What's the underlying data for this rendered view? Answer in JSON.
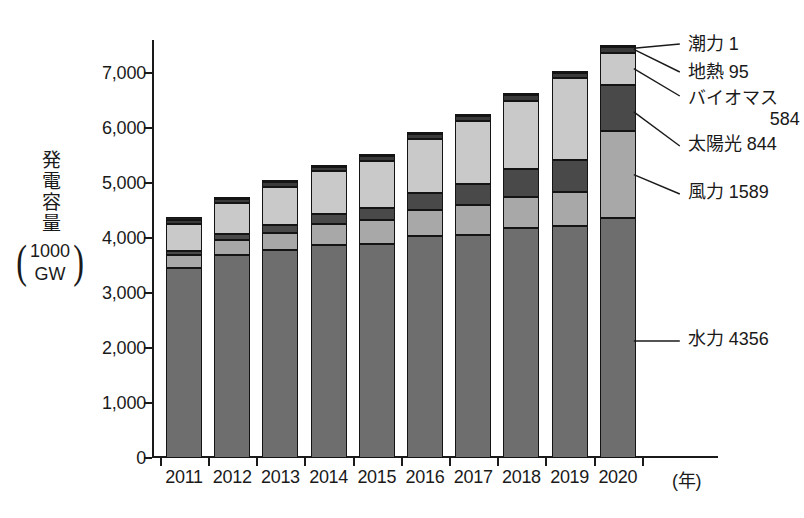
{
  "chart_data": {
    "type": "bar",
    "subtype": "stacked",
    "title": "",
    "xlabel": "(年)",
    "ylabel": "発電容量",
    "yunit_paren": [
      "1000",
      "GW"
    ],
    "categories": [
      "2011",
      "2012",
      "2013",
      "2014",
      "2015",
      "2016",
      "2017",
      "2018",
      "2019",
      "2020"
    ],
    "ylim": [
      0,
      7600
    ],
    "yticks": [
      0,
      1000,
      2000,
      3000,
      4000,
      5000,
      6000,
      7000
    ],
    "ytick_labels": [
      "0",
      "1,000",
      "2,000",
      "3,000",
      "4,000",
      "5,000",
      "6,000",
      "7,000"
    ],
    "grid": false,
    "legend_position": "callout-right",
    "series": [
      {
        "name": "水力",
        "label": "水力 4356",
        "value_2020": 4356,
        "color": "#6e6e6e",
        "values": [
          3460,
          3690,
          3790,
          3880,
          3900,
          4040,
          4060,
          4180,
          4210,
          4356
        ]
      },
      {
        "name": "風力",
        "label": "風力 1589",
        "value_2020": 1589,
        "color": "#a8a8a8",
        "values": [
          230,
          280,
          310,
          370,
          420,
          470,
          540,
          570,
          620,
          1589
        ]
      },
      {
        "name": "太陽光",
        "label": "太陽光 844",
        "value_2020": 844,
        "color": "#494949",
        "values": [
          70,
          100,
          140,
          180,
          230,
          300,
          390,
          510,
          590,
          844
        ]
      },
      {
        "name": "バイオマス",
        "label": "バイオマス 584",
        "value_2020": 584,
        "color": "#c9c9c9",
        "values": [
          500,
          560,
          690,
          780,
          850,
          990,
          1140,
          1240,
          1490,
          584
        ]
      },
      {
        "name": "地熱",
        "label": "地熱 95",
        "value_2020": 95,
        "color": "#3a3a3a",
        "values": [
          75,
          78,
          80,
          82,
          85,
          88,
          90,
          92,
          94,
          95
        ]
      },
      {
        "name": "潮力",
        "label": "潮力 1",
        "value_2020": 1,
        "color": "#1f1f1f",
        "values": [
          1,
          1,
          1,
          1,
          1,
          1,
          1,
          1,
          1,
          1
        ]
      }
    ],
    "totals": [
      4370,
      4730,
      5030,
      5310,
      5500,
      5900,
      6230,
      6600,
      6990,
      7470
    ]
  },
  "callouts": {
    "tidal": "潮力 1",
    "geothermal": "地熱 95",
    "biomass_name": "バイオマス",
    "biomass_value": "584",
    "solar": "太陽光 844",
    "wind": "風力 1589",
    "hydro": "水力 4356"
  }
}
